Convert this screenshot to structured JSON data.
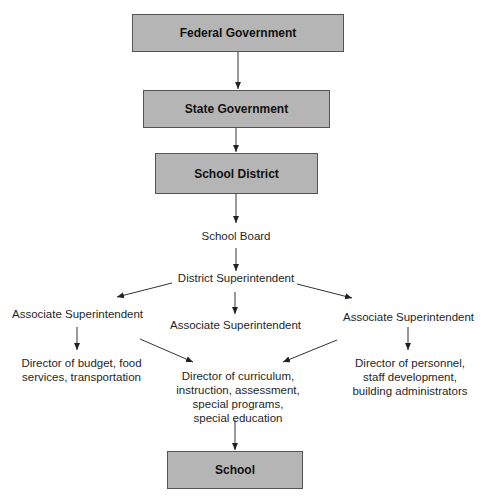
{
  "diagram": {
    "type": "org-chart",
    "nodes": {
      "federal": {
        "label": "Federal Government",
        "style": "box"
      },
      "state": {
        "label": "State Government",
        "style": "box"
      },
      "district": {
        "label": "School District",
        "style": "box"
      },
      "board": {
        "label": "School Board",
        "style": "text"
      },
      "superintendent": {
        "label": "District Superintendent",
        "style": "text"
      },
      "assoc_left": {
        "label": "Associate Superintendent",
        "style": "text"
      },
      "assoc_center": {
        "label": "Associate Superintendent",
        "style": "text"
      },
      "assoc_right": {
        "label": "Associate Superintendent",
        "style": "text"
      },
      "dir_budget": {
        "label": "Director of budget, food services, transportation",
        "style": "text"
      },
      "dir_curriculum": {
        "label": "Director of curriculum, instruction, assessment, special programs, special education",
        "style": "text"
      },
      "dir_personnel": {
        "label": "Director of personnel, staff development, building administrators",
        "style": "text"
      },
      "school": {
        "label": "School",
        "style": "box"
      }
    },
    "edges": [
      [
        "federal",
        "state"
      ],
      [
        "state",
        "district"
      ],
      [
        "district",
        "board"
      ],
      [
        "board",
        "superintendent"
      ],
      [
        "superintendent",
        "assoc_left"
      ],
      [
        "superintendent",
        "assoc_center"
      ],
      [
        "superintendent",
        "assoc_right"
      ],
      [
        "assoc_left",
        "dir_budget"
      ],
      [
        "assoc_left",
        "dir_curriculum"
      ],
      [
        "assoc_right",
        "dir_curriculum"
      ],
      [
        "assoc_right",
        "dir_personnel"
      ],
      [
        "dir_curriculum",
        "school"
      ]
    ],
    "colors": {
      "box_fill": "#b5b5b5",
      "box_border": "#555555",
      "line": "#222222"
    }
  }
}
